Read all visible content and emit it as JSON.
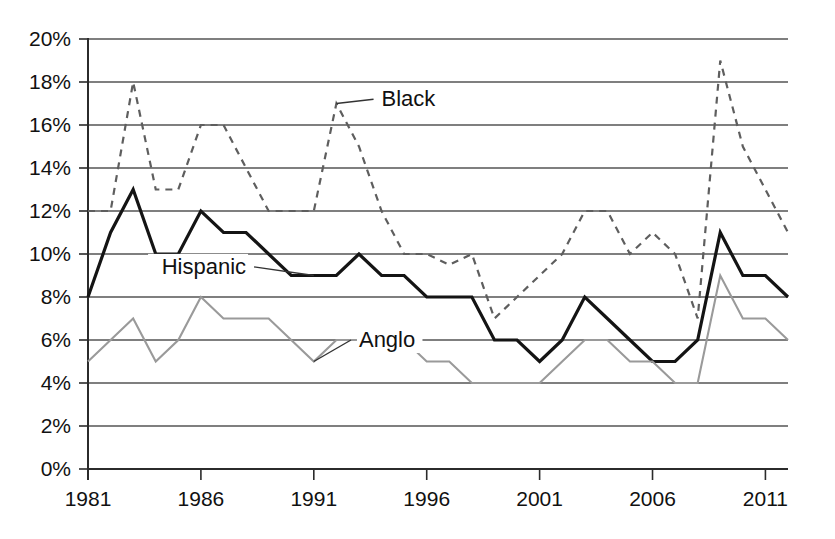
{
  "chart_data": {
    "type": "line",
    "title": "",
    "subtitle": "",
    "xlabel": "",
    "ylabel": "",
    "xlim": [
      1981,
      2012
    ],
    "ylim": [
      0,
      20
    ],
    "ytick_values": [
      0,
      2,
      4,
      6,
      8,
      10,
      12,
      14,
      16,
      18,
      20
    ],
    "ytick_labels": [
      "0%",
      "2%",
      "4%",
      "6%",
      "8%",
      "10%",
      "12%",
      "14%",
      "16%",
      "18%",
      "20%"
    ],
    "xtick_values": [
      1981,
      1986,
      1991,
      1996,
      2001,
      2006,
      2011
    ],
    "xtick_labels": [
      "1981",
      "1986",
      "1991",
      "1996",
      "2001",
      "2006",
      "2011"
    ],
    "grid": "horizontal",
    "legend_position": "inline-annotations",
    "x": [
      1981,
      1982,
      1983,
      1984,
      1985,
      1986,
      1987,
      1988,
      1989,
      1990,
      1991,
      1992,
      1993,
      1994,
      1995,
      1996,
      1997,
      1998,
      1999,
      2000,
      2001,
      2002,
      2003,
      2004,
      2005,
      2006,
      2007,
      2008,
      2009,
      2010,
      2011,
      2012
    ],
    "series": [
      {
        "name": "Black",
        "style": "dashed",
        "color": "#5e5e5e",
        "label": "Black",
        "label_x": 1994.0,
        "label_y": 17.2,
        "anchor_x": 1992.0,
        "anchor_y": 17.0,
        "values": [
          12,
          12,
          18,
          13,
          13,
          16,
          16,
          14,
          12,
          12,
          12,
          17,
          15,
          12,
          10,
          10,
          9.5,
          10,
          7,
          8,
          9,
          10,
          12,
          12,
          10,
          11,
          10,
          7,
          19,
          15,
          13,
          11
        ]
      },
      {
        "name": "Hispanic",
        "style": "solid",
        "color": "#141414",
        "label": "Hispanic",
        "label_x": 1988.0,
        "label_y": 9.4,
        "anchor_x": 1991.0,
        "anchor_y": 9.0,
        "values": [
          8,
          11,
          13,
          10,
          10,
          12,
          11,
          11,
          10,
          9,
          9,
          9,
          10,
          9,
          9,
          8,
          8,
          8,
          6,
          6,
          5,
          6,
          8,
          7,
          6,
          5,
          5,
          6,
          11,
          9,
          9,
          8
        ]
      },
      {
        "name": "Anglo",
        "style": "solid-light",
        "color": "#9a9a9a",
        "label": "Anglo",
        "label_x": 1993.0,
        "label_y": 6.0,
        "anchor_x": 1991.0,
        "anchor_y": 5.0,
        "values": [
          5,
          6,
          7,
          5,
          6,
          8,
          7,
          7,
          7,
          6,
          5,
          6,
          6,
          6,
          6,
          5,
          5,
          4,
          4,
          4,
          4,
          5,
          6,
          6,
          5,
          5,
          4,
          4,
          9,
          7,
          7,
          6
        ]
      }
    ]
  },
  "axes": {
    "plot_left": 88,
    "plot_right": 788,
    "plot_top": 39,
    "plot_bottom": 469
  }
}
